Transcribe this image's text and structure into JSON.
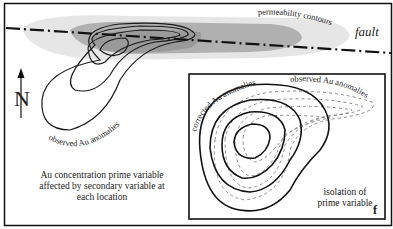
{
  "figure": {
    "panel_letter": "f",
    "north_label": "N",
    "fault_label": "fault",
    "permeability_label": "permeability contours",
    "observed_main_label": "observed Au anomalies",
    "description_lines": [
      "Au concentration prime variable",
      "affected by  secondary variable at",
      "each location"
    ],
    "inset": {
      "corrected_label": "corrected Au anomalies",
      "observed_label": "observed Au anomalies",
      "isolation_lines": [
        "isolation of",
        "prime variable"
      ]
    },
    "colors": {
      "permeability_outer": "#e6e6e6",
      "permeability_inner": "#a9a9a9",
      "permeability_core": "#8f8f8f",
      "contour_line": "#1a1a1a",
      "dashed_contour": "#8a8a8a",
      "border": "#111111"
    }
  }
}
